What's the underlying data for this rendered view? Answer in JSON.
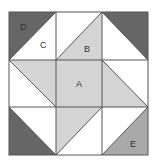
{
  "diagram": {
    "type": "quilt-block",
    "grid": {
      "rows": 3,
      "cols": 3
    },
    "colors": {
      "dark": "#666666",
      "light": "#d4d4d4",
      "medium": "#a9a9a9",
      "white": "#ffffff",
      "line": "#555555"
    },
    "labels": {
      "A": "A",
      "B": "B",
      "C": "C",
      "D": "D",
      "E": "E"
    }
  }
}
